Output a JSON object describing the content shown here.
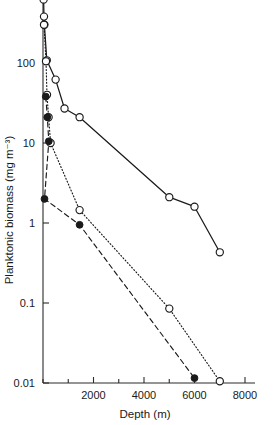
{
  "chart_data": {
    "type": "line",
    "title": "",
    "xlabel": "Depth (m)",
    "ylabel": "Planktonic biomass (mg m⁻³)",
    "xlim": [
      0,
      8000
    ],
    "ylim": [
      0.01,
      1000
    ],
    "yscale": "log",
    "grid": false,
    "legend": "none",
    "xticks": [
      0,
      1000,
      2000,
      3000,
      4000,
      5000,
      6000,
      7000,
      8000
    ],
    "xticklabels": [
      "",
      "",
      "2000",
      "",
      "4000",
      "",
      "6000",
      "",
      "8000"
    ],
    "yticks": [
      0.01,
      0.1,
      1,
      10,
      100
    ],
    "yticklabels": [
      "0.01",
      "0.1",
      "1",
      "10",
      "100"
    ],
    "series": [
      {
        "name": "series-solid-open",
        "marker": "open-circle",
        "linestyle": "solid",
        "color": "#1a1a1a",
        "points": [
          {
            "x": 10,
            "y": 1100
          },
          {
            "x": 25,
            "y": 620
          },
          {
            "x": 40,
            "y": 380
          },
          {
            "x": 55,
            "y": 300
          },
          {
            "x": 150,
            "y": 108
          },
          {
            "x": 500,
            "y": 62
          },
          {
            "x": 850,
            "y": 27
          },
          {
            "x": 1450,
            "y": 21
          },
          {
            "x": 5000,
            "y": 2.1
          },
          {
            "x": 6000,
            "y": 1.6
          },
          {
            "x": 7000,
            "y": 0.43
          }
        ]
      },
      {
        "name": "series-dotted-open",
        "marker": "open-circle",
        "linestyle": "dotted",
        "color": "#1a1a1a",
        "points": [
          {
            "x": 40,
            "y": 300
          },
          {
            "x": 120,
            "y": 105
          },
          {
            "x": 160,
            "y": 40
          },
          {
            "x": 220,
            "y": 21
          },
          {
            "x": 300,
            "y": 10
          },
          {
            "x": 1450,
            "y": 1.45
          },
          {
            "x": 5000,
            "y": 0.085
          },
          {
            "x": 7000,
            "y": 0.0105
          }
        ]
      },
      {
        "name": "series-dashed-filled",
        "marker": "filled-circle",
        "linestyle": "dashed",
        "color": "#1a1a1a",
        "points": [
          {
            "x": 110,
            "y": 38
          },
          {
            "x": 170,
            "y": 21
          },
          {
            "x": 230,
            "y": 10.5
          },
          {
            "x": 60,
            "y": 2.0
          },
          {
            "x": 1450,
            "y": 0.95
          },
          {
            "x": 6000,
            "y": 0.0115
          }
        ]
      }
    ]
  }
}
